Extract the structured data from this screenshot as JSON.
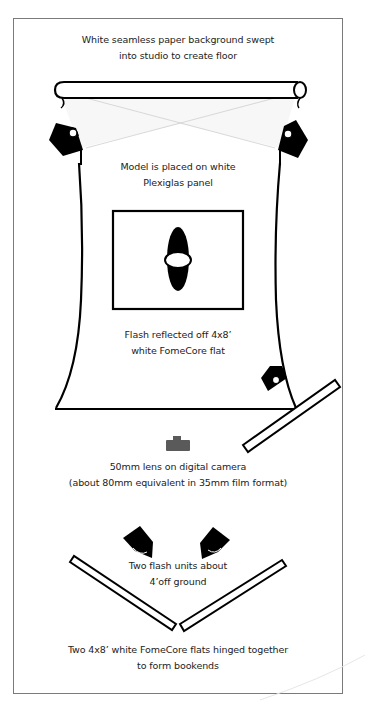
{
  "diagram": {
    "type": "studio-lighting-setup",
    "labels": {
      "backdrop": [
        "White seamless paper background swept",
        "into studio to create floor"
      ],
      "model": [
        "Model is placed on white",
        "Plexiglas panel"
      ],
      "reflector": [
        "Flash reflected off 4x8’",
        "white FomeCore flat"
      ],
      "camera": [
        "50mm lens on digital camera",
        "(about 80mm equivalent in 35mm film format)"
      ],
      "front_flashes": [
        "Two flash units about",
        "4’off ground"
      ],
      "bookends": [
        "Two 4x8’ white FomeCore flats hinged together",
        "to form bookends"
      ]
    },
    "elements": [
      {
        "name": "paper-roll",
        "kind": "backdrop"
      },
      {
        "name": "background-flash-left",
        "kind": "flash"
      },
      {
        "name": "background-flash-right",
        "kind": "flash"
      },
      {
        "name": "plexiglas-panel",
        "kind": "panel"
      },
      {
        "name": "model",
        "kind": "subject"
      },
      {
        "name": "side-flash",
        "kind": "flash"
      },
      {
        "name": "side-fomecore-flat",
        "kind": "reflector"
      },
      {
        "name": "camera",
        "kind": "camera"
      },
      {
        "name": "front-flash-left",
        "kind": "flash"
      },
      {
        "name": "front-flash-right",
        "kind": "flash"
      },
      {
        "name": "bookend-flat-left",
        "kind": "reflector"
      },
      {
        "name": "bookend-flat-right",
        "kind": "reflector"
      }
    ],
    "colors": {
      "ink": "#000000",
      "camera": "#5a5a5a",
      "beam": "#cfcfcf",
      "frame": "#7a7a7a"
    }
  }
}
